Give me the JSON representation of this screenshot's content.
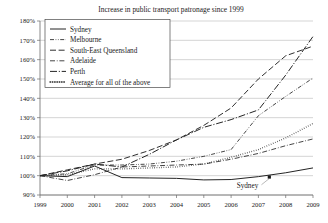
{
  "chart_data": {
    "type": "line",
    "title": "Increase in public transport patronage since 1999",
    "xlabel": "",
    "ylabel": "",
    "xlim": [
      1999,
      2009
    ],
    "ylim": [
      90,
      180
    ],
    "grid": true,
    "legend_position": "top-left",
    "x": [
      1999,
      2000,
      2001,
      2002,
      2003,
      2004,
      2005,
      2006,
      2007,
      2008,
      2009
    ],
    "xtick_labels": [
      "1999",
      "2000",
      "2001",
      "2002",
      "2003",
      "2004",
      "2005",
      "2006",
      "2007",
      "2008",
      "2009"
    ],
    "ytick_labels": [
      "90%",
      "100%",
      "110%",
      "120%",
      "130%",
      "140%",
      "150%",
      "160%",
      "170%",
      "180%"
    ],
    "ytick_values": [
      90,
      100,
      110,
      120,
      130,
      140,
      150,
      160,
      170,
      180
    ],
    "series": [
      {
        "name": "Sydney",
        "style": "solid",
        "values": [
          100,
          99.5,
          105,
          99,
          98.8,
          98.6,
          97.8,
          98,
          99.5,
          101.5,
          104
        ]
      },
      {
        "name": "Melbourne",
        "style": "dash-dot-dot",
        "values": [
          100,
          101,
          105.5,
          105.5,
          106,
          107.5,
          110,
          113.5,
          131,
          141,
          150.5
        ]
      },
      {
        "name": "South-East Queensland",
        "style": "long-dash",
        "values": [
          100,
          103,
          106,
          108.5,
          113,
          118.5,
          126,
          135,
          150,
          162,
          167
        ]
      },
      {
        "name": "Adelaide",
        "style": "dash-dot",
        "values": [
          100,
          97.5,
          100.5,
          104.5,
          105,
          105.5,
          106,
          108.5,
          111.5,
          115.5,
          119
        ]
      },
      {
        "name": "Perth",
        "style": "long-dash-dot",
        "values": [
          100,
          102.5,
          106,
          104.5,
          111,
          118.5,
          125,
          129,
          134,
          152,
          172
        ]
      },
      {
        "name": "Average for all of the above",
        "style": "dotted",
        "values": [
          100,
          100.5,
          103.5,
          103.5,
          104,
          104.5,
          106,
          109.5,
          113.5,
          119.5,
          127
        ]
      }
    ],
    "annotations": [
      {
        "text": "Sydney",
        "x": 2006.6,
        "y": 93.5,
        "points_to": {
          "x": 2007.4,
          "y": 99.3
        }
      }
    ]
  },
  "legend": {
    "items": [
      {
        "label": "Sydney",
        "style": "solid"
      },
      {
        "label": "Melbourne",
        "style": "dash-dot-dot"
      },
      {
        "label": "South-East Queensland",
        "style": "long-dash"
      },
      {
        "label": "Adelaide",
        "style": "dash-dot"
      },
      {
        "label": "Perth",
        "style": "long-dash-dot"
      },
      {
        "label": "Average for all of the above",
        "style": "dotted"
      }
    ]
  },
  "colors": {
    "line": "#242424",
    "grid": "#b9b9b9",
    "axis": "#6b6b6b",
    "text": "#1a1a1a",
    "background": "#ffffff"
  }
}
